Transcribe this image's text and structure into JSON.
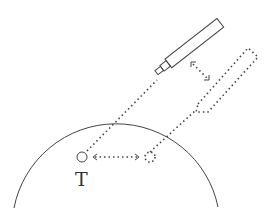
{
  "diagram": {
    "target_label": "T",
    "elements": [
      {
        "name": "body-surface-arc",
        "style": "solid"
      },
      {
        "name": "probe-original",
        "style": "solid"
      },
      {
        "name": "probe-displaced",
        "style": "dotted"
      },
      {
        "name": "target-original",
        "style": "solid",
        "label": "T"
      },
      {
        "name": "target-displaced",
        "style": "dotted"
      },
      {
        "name": "probe-displacement-arrow",
        "style": "dotted",
        "direction": "double"
      },
      {
        "name": "target-displacement-arrow",
        "style": "dotted",
        "direction": "double"
      },
      {
        "name": "beam-line-original",
        "style": "dotted"
      },
      {
        "name": "beam-line-displaced",
        "style": "dotted"
      }
    ],
    "colors": {
      "stroke": "#444444",
      "background": "#ffffff"
    }
  }
}
